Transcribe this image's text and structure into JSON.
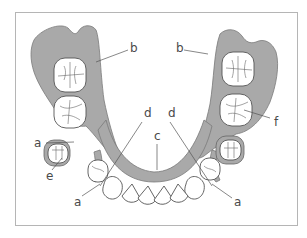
{
  "figure": {
    "type": "dental-partial-denture-diagram",
    "colors": {
      "plate": "#a9a9a9",
      "outline": "#555555",
      "frame": "#b5b5b5",
      "label": "#4a4a4a"
    }
  },
  "labels": {
    "b_left": "b",
    "b_right": "b",
    "d_left": "d",
    "d_right": "d",
    "c": "c",
    "a_left_upper": "a",
    "e": "e",
    "a_left_lower": "a",
    "f": "f",
    "a_right_lower": "a"
  }
}
